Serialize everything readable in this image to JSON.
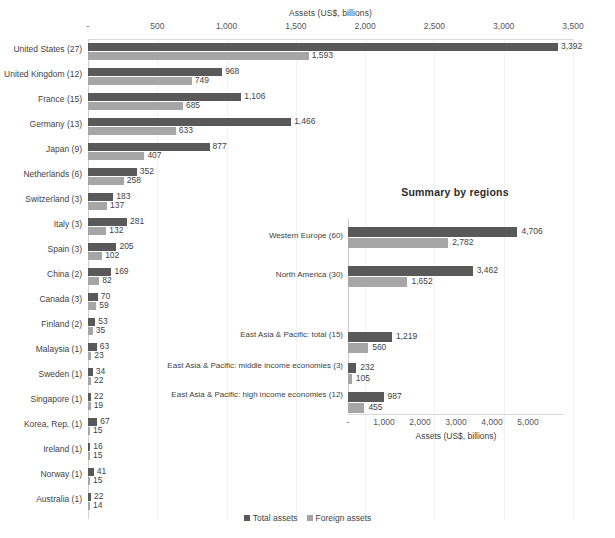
{
  "chart_data": [
    {
      "id": "by-country",
      "type": "bar",
      "orientation": "horizontal",
      "title": "",
      "xlabel": "Assets (US$, billions)",
      "ylabel": "",
      "xlim": [
        0,
        3500
      ],
      "xticks": [
        "-",
        "500",
        "1,000",
        "1,500",
        "2,000",
        "2,500",
        "3,000",
        "3,500"
      ],
      "xtick_values": [
        0,
        500,
        1000,
        1500,
        2000,
        2500,
        3000,
        3500
      ],
      "grid": true,
      "legend_position": "bottom",
      "categories": [
        "United States (27)",
        "United Kingdom (12)",
        "France (15)",
        "Germany (13)",
        "Japan (9)",
        "Netherlands (6)",
        "Switzerland (3)",
        "Italy (3)",
        "Spain (3)",
        "China (2)",
        "Canada (3)",
        "Finland (2)",
        "Malaysia (1)",
        "Sweden (1)",
        "Singapore (1)",
        "Korea, Rep. (1)",
        "Ireland (1)",
        "Norway (1)",
        "Australia (1)"
      ],
      "series": [
        {
          "name": "Total assets",
          "color": "#595959",
          "values": [
            3392,
            968,
            1106,
            1466,
            877,
            352,
            183,
            281,
            205,
            169,
            70,
            53,
            63,
            34,
            22,
            67,
            16,
            41,
            22
          ],
          "labels": [
            "3,392",
            "968",
            "1,106",
            "1,466",
            "877",
            "352",
            "183",
            "281",
            "205",
            "169",
            "70",
            "53",
            "63",
            "34",
            "22",
            "67",
            "16",
            "41",
            "22"
          ]
        },
        {
          "name": "Foreign assets",
          "color": "#a6a6a6",
          "values": [
            1593,
            749,
            685,
            633,
            407,
            258,
            137,
            132,
            102,
            82,
            59,
            35,
            23,
            22,
            19,
            15,
            15,
            15,
            14
          ],
          "labels": [
            "1,593",
            "749",
            "685",
            "633",
            "407",
            "258",
            "137",
            "132",
            "102",
            "82",
            "59",
            "35",
            "23",
            "22",
            "19",
            "15",
            "15",
            "15",
            "14"
          ]
        }
      ]
    },
    {
      "id": "by-region",
      "type": "bar",
      "orientation": "horizontal",
      "title": "Summary by regions",
      "xlabel": "Assets (US$, billions)",
      "ylabel": "",
      "xlim": [
        0,
        5000
      ],
      "xticks": [
        "-",
        "1,000",
        "2,000",
        "3,000",
        "4,000",
        "5,000"
      ],
      "xtick_values": [
        0,
        1000,
        2000,
        3000,
        4000,
        5000
      ],
      "grid": false,
      "legend_position": "bottom",
      "categories": [
        "Western Europe (60)",
        "North America (30)",
        "East Asia & Pacific: total (15)",
        "East Asia & Pacific: middle income economies (3)",
        "East Asia & Pacific: high income economies (12)"
      ],
      "series": [
        {
          "name": "Total assets",
          "color": "#595959",
          "values": [
            4706,
            3462,
            1219,
            232,
            987
          ],
          "labels": [
            "4,706",
            "3,462",
            "1,219",
            "232",
            "987"
          ]
        },
        {
          "name": "Foreign assets",
          "color": "#a6a6a6",
          "values": [
            2782,
            1652,
            560,
            105,
            455
          ],
          "labels": [
            "2,782",
            "1,652",
            "560",
            "105",
            "455"
          ]
        }
      ]
    }
  ],
  "legend": {
    "items": [
      {
        "label": "Total assets",
        "color": "#595959"
      },
      {
        "label": "Foreign assets",
        "color": "#a6a6a6"
      }
    ]
  },
  "colors": {
    "total_assets": "#595959",
    "foreign_assets": "#a6a6a6",
    "axis": "#d9d9d9",
    "text": "#3f3f3f"
  }
}
